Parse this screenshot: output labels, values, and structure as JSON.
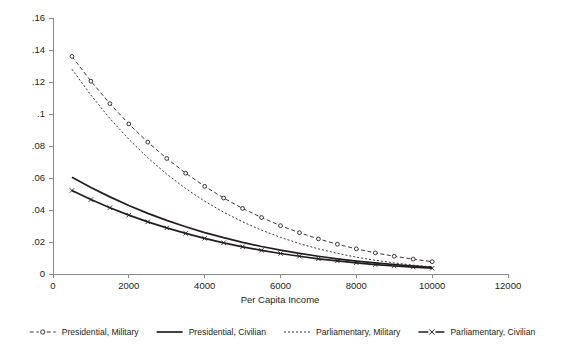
{
  "chart_data": {
    "type": "line",
    "title": "",
    "xlabel": "Per Capita Income",
    "ylabel": "",
    "xlim": [
      0,
      12000
    ],
    "ylim": [
      0,
      0.16
    ],
    "grid": false,
    "legend_position": "bottom",
    "xticks": [
      0,
      2000,
      4000,
      6000,
      8000,
      10000,
      12000
    ],
    "xticklabels": [
      "0",
      "2000",
      "4000",
      "6000",
      "8000",
      "10000",
      "12000"
    ],
    "yticks": [
      0,
      0.02,
      0.04,
      0.06,
      0.08,
      0.1,
      0.12,
      0.14,
      0.16
    ],
    "yticklabels": [
      "0",
      ".02",
      ".04",
      ".06",
      ".08",
      ".1",
      ".12",
      ".14",
      ".16"
    ],
    "x": [
      500,
      1000,
      1500,
      2000,
      2500,
      3000,
      3500,
      4000,
      4500,
      5000,
      5500,
      6000,
      6500,
      7000,
      7500,
      8000,
      8500,
      9000,
      9500,
      10000
    ],
    "series": [
      {
        "name": "Presidential, Military",
        "marker": "circle",
        "linestyle": "dashed",
        "values": [
          0.136,
          0.1205,
          0.1065,
          0.0938,
          0.0824,
          0.0722,
          0.063,
          0.0548,
          0.0475,
          0.041,
          0.0353,
          0.0302,
          0.0258,
          0.0219,
          0.0186,
          0.0157,
          0.0132,
          0.0111,
          0.0093,
          0.0077
        ]
      },
      {
        "name": "Presidential, Civilian",
        "marker": "none",
        "linestyle": "solid",
        "values": [
          0.0605,
          0.054,
          0.0482,
          0.0428,
          0.0379,
          0.0335,
          0.0295,
          0.0259,
          0.0227,
          0.0198,
          0.0172,
          0.0149,
          0.0129,
          0.0111,
          0.0095,
          0.0081,
          0.0069,
          0.0059,
          0.005,
          0.0042
        ]
      },
      {
        "name": "Parliamentary, Military",
        "marker": "none",
        "linestyle": "fine-dashed",
        "values": [
          0.128,
          0.1118,
          0.0972,
          0.0842,
          0.0726,
          0.0624,
          0.0534,
          0.0455,
          0.0386,
          0.0326,
          0.0274,
          0.0229,
          0.019,
          0.0157,
          0.0129,
          0.0105,
          0.0086,
          0.0069,
          0.0055,
          0.0044
        ]
      },
      {
        "name": "Parliamentary, Civilian",
        "marker": "x",
        "linestyle": "solid",
        "values": [
          0.0522,
          0.0465,
          0.0414,
          0.0368,
          0.0326,
          0.0288,
          0.0254,
          0.0223,
          0.0195,
          0.017,
          0.0148,
          0.0128,
          0.0111,
          0.0095,
          0.0082,
          0.007,
          0.0059,
          0.005,
          0.0043,
          0.0036
        ]
      }
    ],
    "colors": {
      "series_line": "#231f20",
      "axis": "#8a8a8a",
      "text": "#231f20",
      "background": "#ffffff"
    }
  },
  "legend": {
    "entries": [
      {
        "label": "Presidential, Military"
      },
      {
        "label": "Presidential, Civilian"
      },
      {
        "label": "Parliamentary, Military"
      },
      {
        "label": "Parliamentary, Civilian"
      }
    ]
  }
}
